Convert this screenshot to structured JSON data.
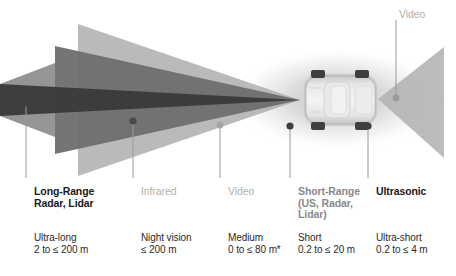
{
  "diagram": {
    "type": "sensor-coverage-diagram",
    "vehicle": "passenger car, top-down view",
    "footnote_marker": "*"
  },
  "colors": {
    "long_range_cone": "#3a3a3a",
    "infrared_cone": "#6e6e6e",
    "video_cone": "#b4b4b4",
    "ultra_long_band": "#8f8f8f",
    "rear_video_cone": "#b4b4b4",
    "short_range_halo": "#d8d8d8",
    "car_body": "#dcdcdc",
    "wheel": "#4a4a4a",
    "leader_line": "#9a9a9a",
    "label_bold": "#1a1a1a",
    "label_mid": "#8a8a8a",
    "label_light": "#b0b0b0",
    "range_text": "#2b2b2b",
    "background": "#ffffff"
  },
  "top_label": {
    "name": "Video"
  },
  "sensors": [
    {
      "id": "long-range",
      "name_lines": [
        "Long-Range",
        "Radar, Lidar"
      ],
      "range_lines": [
        "Ultra-long",
        "2 to ≤ 200 m"
      ],
      "style": "bold",
      "dot_color": "#3f3f3f",
      "range_label": "Ultra-long",
      "range_value": "2 to ≤ 200 m"
    },
    {
      "id": "infrared",
      "name_lines": [
        "Infrared"
      ],
      "range_lines": [
        "Night vision",
        "≤ 200 m"
      ],
      "style": "light",
      "dot_color": "#4a4a4a",
      "range_label": "Night vision",
      "range_value": "≤ 200 m"
    },
    {
      "id": "video",
      "name_lines": [
        "Video"
      ],
      "range_lines": [
        "Medium",
        "0 to ≤ 80 m*"
      ],
      "style": "light",
      "dot_color": "#a5a5a5",
      "range_label": "Medium",
      "range_value": "0 to ≤ 80 m*"
    },
    {
      "id": "short-range",
      "name_lines": [
        "Short-Range",
        "(US, Radar,",
        "Lidar)"
      ],
      "range_lines": [
        "Short",
        "0.2 to ≤ 20 m"
      ],
      "style": "mid",
      "dot_color": "#3f3f3f",
      "range_label": "Short",
      "range_value": "0.2 to ≤ 20 m"
    },
    {
      "id": "ultrasonic",
      "name_lines": [
        "Ultrasonic"
      ],
      "range_lines": [
        "Ultra-short",
        "0.2 to ≤ 4 m"
      ],
      "style": "bold",
      "dot_color": "#3f3f3f",
      "range_label": "Ultra-short",
      "range_value": "0.2 to ≤ 4 m"
    }
  ]
}
